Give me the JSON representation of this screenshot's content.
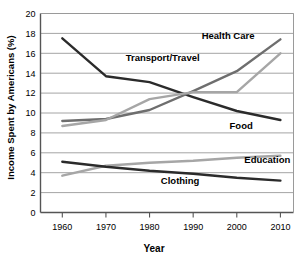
{
  "chart_data": {
    "type": "line",
    "title": "",
    "xlabel": "Year",
    "ylabel": "Income Spent by Americans (%)",
    "x": [
      1960,
      1970,
      1980,
      1990,
      2000,
      2010
    ],
    "xlim": [
      1955,
      2013
    ],
    "ylim": [
      0,
      20
    ],
    "yticks": [
      0,
      2,
      4,
      6,
      8,
      10,
      12,
      14,
      16,
      18,
      20
    ],
    "xticks": [
      1960,
      1970,
      1980,
      1990,
      2000,
      2010
    ],
    "xtick_labels": [
      "1960",
      "1970",
      "1980",
      "1990",
      "2000",
      "2010"
    ],
    "ytick_labels": [
      "0",
      "2",
      "4",
      "6",
      "8",
      "10",
      "12",
      "14",
      "16",
      "18",
      "20"
    ],
    "grid": "horizontal",
    "legend": "inline-labels",
    "series": [
      {
        "name": "Food",
        "label": "Food",
        "color": "#2b2b2b",
        "width": 2.4,
        "values": [
          17.5,
          13.7,
          13.1,
          11.6,
          10.2,
          9.3
        ],
        "label_x": 2001,
        "label_y": 8.4
      },
      {
        "name": "Health Care",
        "label": "Health Care",
        "color": "#6e6e6e",
        "width": 2.4,
        "values": [
          9.2,
          9.4,
          10.3,
          12.2,
          14.2,
          17.4
        ],
        "label_x": 1998,
        "label_y": 17.4
      },
      {
        "name": "Transport/Travel",
        "label": "Transport/Travel",
        "color": "#a6a6a6",
        "width": 2.4,
        "values": [
          8.7,
          9.3,
          11.4,
          12.1,
          12.1,
          16.0
        ],
        "label_x": 1983,
        "label_y": 15.2
      },
      {
        "name": "Education",
        "label": "Education",
        "color": "#a6a6a6",
        "width": 2.4,
        "values": [
          3.7,
          4.7,
          5.0,
          5.2,
          5.5,
          5.7
        ],
        "label_x": 2007,
        "label_y": 5.0
      },
      {
        "name": "Clothing",
        "label": "Clothing",
        "color": "#2b2b2b",
        "width": 2.4,
        "values": [
          5.1,
          4.6,
          4.2,
          3.9,
          3.5,
          3.2
        ],
        "label_x": 1987,
        "label_y": 2.9
      }
    ]
  }
}
